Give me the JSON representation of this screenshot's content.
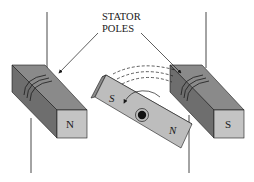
{
  "diagram": {
    "callout": {
      "line1": "STATOR",
      "line2": "POLES"
    },
    "left_pole": {
      "face_label": "N"
    },
    "right_pole": {
      "face_label": "S"
    },
    "rotor": {
      "south_label": "S",
      "north_label": "N"
    }
  },
  "colors": {
    "pole_top": "#8a8a8a",
    "pole_side": "#6e6e6e",
    "pole_face": "#c4c4c4",
    "rotor_face": "#bdbdbd",
    "rotor_edge": "#8c8c8c",
    "line": "#1a1a1a"
  }
}
